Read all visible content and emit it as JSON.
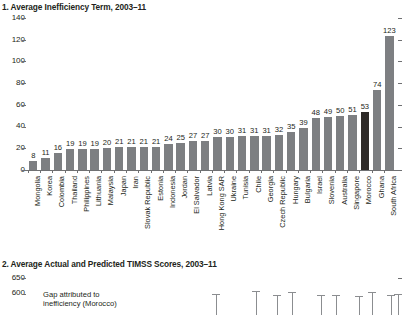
{
  "panel1": {
    "title": "1. Average Inefficiency Term, 2003–11"
  },
  "panel2": {
    "title": "2. Average Actual and Predicted TIMSS Scores, 2003–11",
    "annotation_line1": "Gap attributed to",
    "annotation_line2": "inefficiency (Morocco)",
    "yticks": [
      "650",
      "600"
    ]
  },
  "chart_data": [
    {
      "type": "bar",
      "title": "1. Average Inefficiency Term, 2003–11",
      "xlabel": "",
      "ylabel": "",
      "ylim": [
        0,
        140
      ],
      "yticks": [
        0,
        20,
        40,
        60,
        80,
        100,
        120,
        140
      ],
      "grid": false,
      "legend": "none",
      "bar_color": "#7d7f82",
      "highlight_color": "#2e2a28",
      "highlight_category": "Morocco",
      "categories": [
        "Mongolia",
        "Korea",
        "Colombia",
        "Thailand",
        "Philippines",
        "Lithuania",
        "Malaysia",
        "Japan",
        "Iran",
        "Slovak Republic",
        "Estonia",
        "Indonesia",
        "Jordan",
        "El Salvador",
        "Latvia",
        "Hong Kong SAR",
        "Ukraine",
        "Tunisia",
        "Chile",
        "Georgia",
        "Czech Republic",
        "Hungary",
        "Bulgaria",
        "Israel",
        "Slovenia",
        "Australia",
        "Singapore",
        "Morocco",
        "Ghana",
        "South Africa"
      ],
      "values": [
        8,
        11,
        16,
        19,
        19,
        19,
        20,
        21,
        21,
        21,
        21,
        24,
        25,
        27,
        27,
        30,
        30,
        31,
        31,
        31,
        32,
        35,
        39,
        48,
        49,
        50,
        51,
        53,
        74,
        123
      ]
    },
    {
      "type": "bar",
      "title": "2. Average Actual and Predicted TIMSS Scores, 2003–11",
      "ylim": [
        580,
        660
      ],
      "yticks": [
        600,
        650
      ],
      "grid": false,
      "note": "Panel cropped at bottom of screenshot; only upper error-bar caps visible.",
      "annotations": [
        "Gap attributed to",
        "inefficiency (Morocco)"
      ],
      "series": [
        {
          "name": "error-bar-caps",
          "x": [
            216,
            256,
            277,
            292,
            321,
            336,
            359,
            372,
            391,
            398
          ],
          "top_values": [
            597,
            609,
            596,
            604,
            596,
            596,
            592,
            604,
            596,
            599
          ]
        }
      ]
    }
  ]
}
